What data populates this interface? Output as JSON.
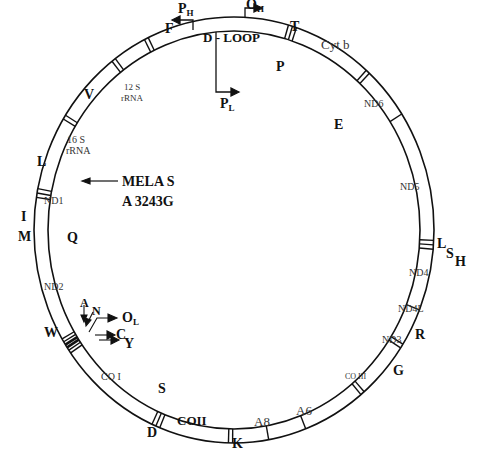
{
  "diagram": {
    "center": [
      234,
      230
    ],
    "outer_radius": [
      200,
      213
    ],
    "inner_radius": [
      186,
      199
    ],
    "ring_color": "#111111",
    "separators": [
      {
        "angle": -26,
        "lines": 2,
        "trna": "F"
      },
      {
        "angle": 17,
        "lines": 3,
        "trna": "T/P"
      },
      {
        "angle": 42,
        "lines": 2,
        "trna": "E"
      },
      {
        "angle": 57,
        "lines": 1,
        "trna": ""
      },
      {
        "angle": 94,
        "lines": 3,
        "trna": "H/S/L"
      },
      {
        "angle": 112,
        "lines": 1,
        "trna": ""
      },
      {
        "angle": 123,
        "lines": 2,
        "trna": "R"
      },
      {
        "angle": 140,
        "lines": 2,
        "trna": "G"
      },
      {
        "angle": 159,
        "lines": 1,
        "trna": ""
      },
      {
        "angle": 170,
        "lines": 1,
        "trna": ""
      },
      {
        "angle": 181,
        "lines": 2,
        "trna": "K"
      },
      {
        "angle": 203,
        "lines": 3,
        "trna": "S/D"
      },
      {
        "angle": 237,
        "lines": 6,
        "trna": "W/A/N/C/Y"
      },
      {
        "angle": 280,
        "lines": 3,
        "trna": "I/Q/M"
      },
      {
        "angle": 302,
        "lines": 2,
        "trna": "L"
      },
      {
        "angle": 323,
        "lines": 2,
        "trna": "V"
      }
    ],
    "genes": {
      "dloop": "D - LOOP",
      "cytb": "Cyt b",
      "nd6": "ND6",
      "nd5": "ND5",
      "nd4": "ND4",
      "nd4l": "ND4L",
      "nd3": "ND3",
      "co3": "CO III",
      "a6": "A6",
      "a8": "A8",
      "co2": "COII",
      "co1": "CO I",
      "nd2": "ND2",
      "nd1": "ND1",
      "rrna16_a": "16 S",
      "rrna16_b": "rRNA",
      "rrna12_a": "12 S",
      "rrna12_b": "rRNA"
    },
    "trna_labels": {
      "F": "F",
      "T": "T",
      "P": "P",
      "E": "E",
      "L_right": "L",
      "S_right": "S",
      "H_right": "H",
      "R": "R",
      "G": "G",
      "K": "K",
      "S": "S",
      "D": "D",
      "W": "W",
      "A": "A",
      "N": "N",
      "C": "C",
      "Y": "Y",
      "I": "I",
      "M": "M",
      "Q": "Q",
      "L_left": "L",
      "V": "V"
    },
    "promoters": {
      "ph": "P",
      "ph_sub": "H",
      "oh": "O",
      "oh_sub": "H",
      "pl": "P",
      "pl_sub": "L",
      "ol": "O",
      "ol_sub": "L"
    },
    "mutation": {
      "line1": "MELA S",
      "line2": "A 3243G"
    }
  }
}
